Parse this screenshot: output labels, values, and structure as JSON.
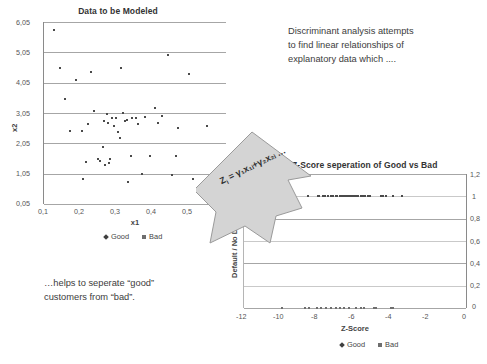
{
  "slide": {
    "note_right": [
      "Discriminant analysis attempts",
      "to find linear relationships of",
      "explanatory data which ...."
    ],
    "note_bottom": [
      "…helps to seperate “good”",
      "customers from “bad”."
    ],
    "arrow_formula": "Z",
    "arrow_formula_sub": "i",
    "arrow_formula_rest": " = γ₁x₁ᵢ+γ₂x₂ᵢ …",
    "colors": {
      "text": "#3c3c3c",
      "marker_good": "#4a4a4a",
      "marker_bad": "#6e6e6e",
      "gridline": "#a6a6a6",
      "arrow_fill": "#d4d4d4",
      "arrow_stroke": "#8f8f8f"
    }
  },
  "chart_data": [
    {
      "id": "left",
      "type": "scatter",
      "title": "Data to be Modeled",
      "xlabel": "x1",
      "ylabel": "x2",
      "xlim": [
        0.1,
        0.6
      ],
      "ylim": [
        0.05,
        6.05
      ],
      "xticks": [
        "0,1",
        "0,2",
        "0,3",
        "0,4",
        "0,5",
        "0,6"
      ],
      "xtick_values": [
        0.1,
        0.2,
        0.3,
        0.4,
        0.5,
        0.6
      ],
      "yticks": [
        "0,05",
        "1,05",
        "2,05",
        "3,05",
        "4,05",
        "5,05",
        "6,05"
      ],
      "ytick_values": [
        0.05,
        1.05,
        2.05,
        3.05,
        4.05,
        5.05,
        6.05
      ],
      "grid": true,
      "legend": [
        "Good",
        "Bad"
      ],
      "legend_position": "bottom",
      "series": [
        {
          "name": "Good",
          "marker": "diamond",
          "points": [
            [
              0.127,
              5.78
            ],
            [
              0.145,
              4.52
            ],
            [
              0.158,
              3.5
            ],
            [
              0.172,
              2.45
            ],
            [
              0.188,
              4.15
            ],
            [
              0.205,
              2.45
            ],
            [
              0.208,
              0.88
            ],
            [
              0.215,
              1.42
            ],
            [
              0.222,
              2.7
            ],
            [
              0.228,
              4.39
            ],
            [
              0.238,
              3.12
            ],
            [
              0.248,
              1.55
            ],
            [
              0.255,
              1.47
            ],
            [
              0.262,
              1.92
            ],
            [
              0.265,
              2.8
            ],
            [
              0.268,
              1.35
            ],
            [
              0.272,
              3.03
            ],
            [
              0.275,
              2.72
            ],
            [
              0.278,
              1.4
            ],
            [
              0.282,
              1.53
            ],
            [
              0.288,
              2.88
            ],
            [
              0.292,
              2.62
            ],
            [
              0.298,
              2.9
            ],
            [
              0.302,
              2.42
            ],
            [
              0.308,
              2.22
            ],
            [
              0.312,
              4.55
            ],
            [
              0.318,
              3.05
            ],
            [
              0.322,
              2.78
            ],
            [
              0.328,
              2.82
            ],
            [
              0.332,
              0.78
            ],
            [
              0.338,
              1.62
            ],
            [
              0.342,
              2.9
            ],
            [
              0.352,
              2.88
            ],
            [
              0.358,
              2.7
            ],
            [
              0.368,
              1.05
            ],
            [
              0.378,
              2.92
            ],
            [
              0.392,
              1.62
            ],
            [
              0.405,
              3.22
            ],
            [
              0.412,
              2.72
            ],
            [
              0.425,
              2.95
            ],
            [
              0.442,
              4.95
            ],
            [
              0.452,
              1.02
            ],
            [
              0.462,
              1.62
            ],
            [
              0.468,
              2.55
            ],
            [
              0.498,
              4.32
            ],
            [
              0.508,
              0.88
            ],
            [
              0.548,
              2.62
            ]
          ]
        },
        {
          "name": "Bad",
          "marker": "square",
          "points": []
        }
      ]
    },
    {
      "id": "right",
      "type": "scatter",
      "title": "Z-Score seperation of Good vs Bad",
      "xlabel": "Z-Score",
      "ylabel": "Default / No Default",
      "xlim": [
        -12,
        0
      ],
      "ylim": [
        0,
        1.2
      ],
      "xticks": [
        "-12",
        "-10",
        "-8",
        "-6",
        "-4",
        "-2",
        "0"
      ],
      "xtick_values": [
        -12,
        -10,
        -8,
        -6,
        -4,
        -2,
        0
      ],
      "yticks": [
        "0",
        "0,2",
        "0,4",
        "0,6",
        "0,8",
        "1",
        "1,2"
      ],
      "ytick_values": [
        0,
        0.2,
        0.4,
        0.6,
        0.8,
        1.0,
        1.2
      ],
      "grid": true,
      "legend": [
        "Good",
        "Bad"
      ],
      "legend_position": "bottom",
      "series": [
        {
          "name": "Good",
          "marker": "diamond",
          "points": [
            [
              -8.55,
              1
            ],
            [
              -8.0,
              1
            ],
            [
              -7.92,
              1
            ],
            [
              -7.72,
              1
            ],
            [
              -7.6,
              1
            ],
            [
              -7.48,
              1
            ],
            [
              -7.28,
              1
            ],
            [
              -7.2,
              1
            ],
            [
              -7.05,
              1
            ],
            [
              -6.95,
              1
            ],
            [
              -6.8,
              1
            ],
            [
              -6.7,
              1
            ],
            [
              -6.58,
              1
            ],
            [
              -6.48,
              1
            ],
            [
              -6.38,
              1
            ],
            [
              -6.28,
              1
            ],
            [
              -6.15,
              1
            ],
            [
              -6.05,
              1
            ],
            [
              -5.95,
              1
            ],
            [
              -5.82,
              1
            ],
            [
              -5.7,
              1
            ],
            [
              -5.58,
              1
            ],
            [
              -5.45,
              1
            ],
            [
              -5.32,
              1
            ],
            [
              -5.18,
              1
            ],
            [
              -4.62,
              1
            ],
            [
              -4.48,
              1
            ],
            [
              -4.35,
              1
            ],
            [
              -3.95,
              1
            ],
            [
              -3.45,
              1
            ]
          ]
        },
        {
          "name": "Bad",
          "marker": "square",
          "points": [
            [
              -9.95,
              0
            ],
            [
              -8.72,
              0
            ],
            [
              -8.48,
              0
            ],
            [
              -8.05,
              0
            ],
            [
              -7.82,
              0
            ],
            [
              -7.55,
              0
            ],
            [
              -7.32,
              0
            ],
            [
              -7.05,
              0
            ],
            [
              -6.82,
              0
            ],
            [
              -6.58,
              0
            ],
            [
              -6.35,
              0
            ],
            [
              -5.95,
              0
            ],
            [
              -5.7,
              0
            ],
            [
              -5.52,
              0
            ],
            [
              -4.98,
              0
            ],
            [
              -4.88,
              0
            ],
            [
              -4.05,
              0
            ],
            [
              -3.95,
              0
            ]
          ]
        }
      ]
    }
  ]
}
